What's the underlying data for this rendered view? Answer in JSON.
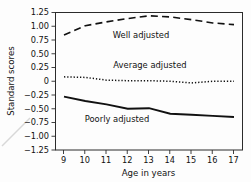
{
  "chart_data": {
    "type": "line",
    "title": "",
    "xlabel": "Age in years",
    "ylabel": "Standard scores",
    "x": [
      9,
      10,
      11,
      12,
      13,
      14,
      15,
      16,
      17
    ],
    "xlim": [
      8.6,
      17.4
    ],
    "ylim": [
      -1.25,
      1.25
    ],
    "xtick_labels": [
      "9",
      "10",
      "11",
      "12",
      "13",
      "14",
      "15",
      "16",
      "17"
    ],
    "ytick_values": [
      1.25,
      1.0,
      0.75,
      0.5,
      0.25,
      0,
      -0.25,
      -0.5,
      -0.75,
      -1.0,
      -1.25
    ],
    "ytick_labels": [
      "1.25",
      "1.00",
      "0.75",
      "0.50",
      "0.25",
      "0",
      "−0.25",
      "−0.50",
      "−0.75",
      "−1.00",
      "−1.25"
    ],
    "grid": false,
    "legend_position": "inline-annotations",
    "series": [
      {
        "name": "Well adjusted",
        "style": "dashed",
        "color": "#111111",
        "values": [
          0.84,
          1.01,
          1.08,
          1.14,
          1.19,
          1.17,
          1.12,
          1.06,
          1.03
        ],
        "label_text": "Well adjusted"
      },
      {
        "name": "Average adjusted",
        "style": "dotted",
        "color": "#111111",
        "values": [
          0.08,
          0.07,
          0.02,
          0.01,
          0.01,
          0.0,
          -0.03,
          0.0,
          0.0
        ],
        "label_text": "Average adjusted"
      },
      {
        "name": "Poorly adjusted",
        "style": "solid",
        "color": "#111111",
        "values": [
          -0.28,
          -0.36,
          -0.42,
          -0.5,
          -0.49,
          -0.59,
          -0.61,
          -0.63,
          -0.65
        ],
        "label_text": "Poorly adjusted"
      }
    ]
  },
  "axis": {
    "y_title": "Standard scores",
    "x_title": "Age in years"
  },
  "annotations": {
    "well": "Well adjusted",
    "average": "Average adjusted",
    "poor": "Poorly adjusted"
  },
  "ticks": {
    "x": [
      "9",
      "10",
      "11",
      "12",
      "13",
      "14",
      "15",
      "16",
      "17"
    ],
    "y": [
      "1.25",
      "1.00",
      "0.75",
      "0.50",
      "0.25",
      "0",
      "−0.25",
      "−0.50",
      "−0.75",
      "−1.00",
      "−1.25"
    ]
  },
  "colors": {
    "ink": "#111111",
    "frame": "#2b2b2b",
    "background": "#fdfdfd"
  }
}
